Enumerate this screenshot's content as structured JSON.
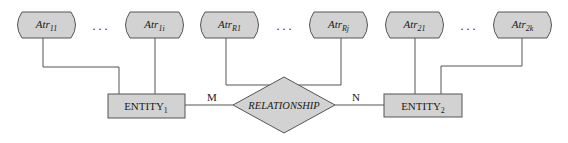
{
  "attributes": [
    {
      "id": "atr11",
      "base": "Atr",
      "sub": "11",
      "x": 15,
      "lineX": 43
    },
    {
      "id": "atr1i",
      "base": "Atr",
      "sub": "1i",
      "x": 123,
      "lineX": 155
    },
    {
      "id": "atrR1",
      "base": "Atr",
      "sub": "R1",
      "x": 198,
      "lineX": 226
    },
    {
      "id": "atrRj",
      "base": "Atr",
      "sub": "Rj",
      "x": 307,
      "lineX": 341
    },
    {
      "id": "atr21",
      "base": "Atr",
      "sub": "21",
      "x": 383,
      "lineX": 415
    },
    {
      "id": "atr2k",
      "base": "Atr",
      "sub": "2k",
      "x": 491,
      "lineX": 522
    }
  ],
  "ellipsis": ". . .",
  "entity1": {
    "base": "ENTITY",
    "sub": "1"
  },
  "entity2": {
    "base": "ENTITY",
    "sub": "2"
  },
  "relationship": {
    "label": "RELATIONSHIP"
  },
  "cardinality": {
    "left": "M",
    "right": "N"
  },
  "colors": {
    "fill": "#d2d2d2",
    "stroke": "#555555",
    "line": "#555555"
  }
}
